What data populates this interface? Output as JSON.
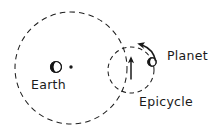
{
  "diagram": {
    "background_color": "#ffffff",
    "stroke_color": "#1a1a1a",
    "labels": {
      "earth": "Earth",
      "planet": "Planet",
      "epicycle": "Epicycle"
    },
    "bodies": [
      {
        "name": "earth",
        "label": "Earth",
        "cx": 56,
        "cy": 67,
        "r": 5.5,
        "shading": "half-dark"
      },
      {
        "name": "planet",
        "label": "Planet",
        "cx": 152,
        "cy": 62,
        "r": 4.2,
        "shading": "half-dark"
      }
    ],
    "points": [
      {
        "name": "deferent-center",
        "cx": 71,
        "cy": 67,
        "r": 1.6
      }
    ],
    "orbits": [
      {
        "name": "deferent",
        "cx": 71,
        "cy": 68,
        "r": 56,
        "style": "dashed"
      },
      {
        "name": "epicycle",
        "label": "Epicycle",
        "cx": 131,
        "cy": 70,
        "r": 23,
        "style": "dashed"
      }
    ],
    "arrows": [
      {
        "name": "deferent-motion-arrow",
        "type": "straight",
        "direction": "up",
        "x": 131,
        "y_start": 79,
        "y_end": 57
      },
      {
        "name": "epicycle-motion-arrow",
        "type": "curved",
        "direction": "counterclockwise",
        "from_x": 153,
        "from_y": 58,
        "to_x": 138,
        "to_y": 45
      }
    ]
  }
}
